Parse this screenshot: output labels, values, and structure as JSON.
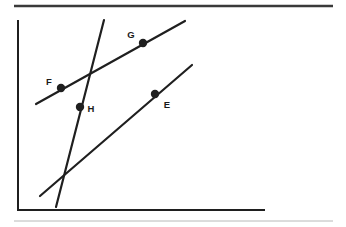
{
  "figure": {
    "background_color": "#ffffff",
    "stroke_color": "#1f1f1f",
    "rule_color": "#d0d0d0",
    "canvas": {
      "width": 346,
      "height": 227
    }
  },
  "rules": [
    {
      "name": "top-rule",
      "kind": "horizontal-rule",
      "x1": 14,
      "y1": 6,
      "x2": 333,
      "y2": 6,
      "thickness": 2.4,
      "color": "#3a3a3a"
    },
    {
      "name": "bottom-rule",
      "kind": "horizontal-rule",
      "x1": 14,
      "y1": 221,
      "x2": 333,
      "y2": 221,
      "thickness": 1.0,
      "color": "#b8b8b8"
    }
  ],
  "axes": {
    "vertical": {
      "name": "y-axis",
      "x1": 18,
      "y1": 21,
      "x2": 18,
      "y2": 210,
      "thickness": 2.0,
      "color": "#1f1f1f"
    },
    "horizontal": {
      "name": "x-axis",
      "x1": 18,
      "y1": 210,
      "x2": 264,
      "y2": 210,
      "thickness": 2.0,
      "color": "#1f1f1f"
    }
  },
  "lines": [
    {
      "name": "line-fg",
      "label": "line through F and G",
      "x1": 36,
      "y1": 104,
      "x2": 185,
      "y2": 21,
      "thickness": 2.2,
      "color": "#1f1f1f"
    },
    {
      "name": "line-e",
      "label": "line through E",
      "x1": 40,
      "y1": 196,
      "x2": 192,
      "y2": 65,
      "thickness": 2.2,
      "color": "#1f1f1f"
    },
    {
      "name": "line-transversal-h",
      "label": "transversal through H",
      "x1": 104,
      "y1": 20,
      "x2": 56,
      "y2": 207,
      "thickness": 2.2,
      "color": "#1f1f1f"
    }
  ],
  "points": [
    {
      "name": "point-f",
      "label": "F",
      "cx": 61,
      "cy": 88,
      "r": 4.2,
      "label_x": 49,
      "label_y": 85,
      "label_anchor": "middle",
      "on_line": "line-fg"
    },
    {
      "name": "point-g",
      "label": "G",
      "cx": 143,
      "cy": 43,
      "r": 4.2,
      "label_x": 131,
      "label_y": 38,
      "label_anchor": "middle",
      "on_line": "line-fg"
    },
    {
      "name": "point-h",
      "label": "H",
      "cx": 80,
      "cy": 107,
      "r": 4.2,
      "label_x": 91,
      "label_y": 112,
      "label_anchor": "middle",
      "on_line": "line-transversal-h"
    },
    {
      "name": "point-e",
      "label": "E",
      "cx": 155,
      "cy": 94,
      "r": 4.2,
      "label_x": 167,
      "label_y": 108,
      "label_anchor": "middle",
      "on_line": "line-e"
    }
  ],
  "intersections": [
    {
      "name": "intersection-fg-transversal",
      "label": "",
      "x": 94,
      "y": 70,
      "lines": [
        "line-fg",
        "line-transversal-h"
      ]
    },
    {
      "name": "intersection-e-transversal",
      "label": "",
      "x": 66,
      "y": 171,
      "lines": [
        "line-e",
        "line-transversal-h"
      ]
    }
  ]
}
